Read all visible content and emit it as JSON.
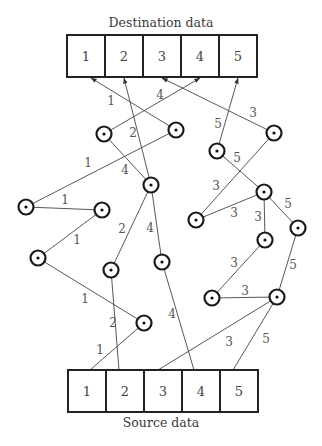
{
  "destination": {
    "title": "Destination data",
    "cells": [
      "1",
      "2",
      "3",
      "4",
      "5"
    ],
    "box": {
      "x": 67,
      "y": 35,
      "cell_w": 38,
      "h": 42
    }
  },
  "source": {
    "title": "Source data",
    "cells": [
      "1",
      "2",
      "3",
      "4",
      "5"
    ],
    "box": {
      "x": 68,
      "y": 370,
      "cell_w": 38,
      "h": 42
    }
  },
  "nodes": {
    "A": [
      104,
      134
    ],
    "B": [
      176,
      130
    ],
    "C": [
      151,
      185
    ],
    "D": [
      26,
      207
    ],
    "E": [
      102,
      210
    ],
    "F": [
      38,
      258
    ],
    "G": [
      111,
      270
    ],
    "H": [
      162,
      262
    ],
    "I": [
      144,
      323
    ],
    "J": [
      217,
      151
    ],
    "K": [
      274,
      133
    ],
    "L": [
      264,
      192
    ],
    "M": [
      196,
      220
    ],
    "N": [
      298,
      228
    ],
    "O": [
      265,
      240
    ],
    "P": [
      212,
      298
    ],
    "Q": [
      277,
      297
    ]
  },
  "edges": [
    {
      "from": "src1",
      "to": "I",
      "label": "1",
      "lp": [
        100,
        350
      ]
    },
    {
      "from": "I",
      "to": "F",
      "label": "1",
      "lp": [
        85,
        299
      ]
    },
    {
      "from": "F",
      "to": "E",
      "label": "1",
      "lp": [
        77,
        240
      ]
    },
    {
      "from": "E",
      "to": "D",
      "label": "1",
      "lp": [
        65,
        200
      ]
    },
    {
      "from": "D",
      "to": "B",
      "label": "1",
      "lp": [
        88,
        163
      ]
    },
    {
      "from": "B",
      "to": "dst1",
      "label": "1",
      "lp": [
        111,
        101
      ]
    },
    {
      "from": "src2",
      "to": "G",
      "label": "2",
      "lp": [
        113,
        323
      ]
    },
    {
      "from": "G",
      "to": "C",
      "label": "2",
      "lp": [
        122,
        229
      ]
    },
    {
      "from": "C",
      "to": "dst2",
      "label": "2",
      "lp": [
        133,
        133
      ]
    },
    {
      "from": "src4",
      "to": "H",
      "label": "4",
      "lp": [
        172,
        314
      ]
    },
    {
      "from": "H",
      "to": "C",
      "label": "4",
      "lp": [
        150,
        228
      ]
    },
    {
      "from": "C",
      "to": "A",
      "label": "4",
      "lp": [
        125,
        170
      ]
    },
    {
      "from": "A",
      "to": "dst4",
      "label": "4",
      "lp": [
        160,
        95
      ]
    },
    {
      "from": "src3",
      "to": "Q",
      "label": "3",
      "lp": [
        229,
        342
      ]
    },
    {
      "from": "Q",
      "to": "P",
      "label": "3",
      "lp": [
        245,
        291
      ]
    },
    {
      "from": "P",
      "to": "O",
      "label": "3",
      "lp": [
        234,
        263
      ]
    },
    {
      "from": "O",
      "to": "L",
      "label": "3",
      "lp": [
        258,
        217
      ]
    },
    {
      "from": "L",
      "to": "M",
      "label": "3",
      "lp": [
        234,
        213
      ]
    },
    {
      "from": "M",
      "to": "K",
      "label": "3",
      "lp": [
        216,
        186
      ]
    },
    {
      "from": "K",
      "to": "dst3",
      "label": "3",
      "lp": [
        253,
        113
      ]
    },
    {
      "from": "src5",
      "to": "Q",
      "label": "5",
      "lp": [
        266,
        339
      ]
    },
    {
      "from": "Q",
      "to": "N",
      "label": "5",
      "lp": [
        293,
        265
      ]
    },
    {
      "from": "N",
      "to": "L",
      "label": "5",
      "lp": [
        288,
        204
      ]
    },
    {
      "from": "L",
      "to": "J",
      "label": "5",
      "lp": [
        237,
        158
      ]
    },
    {
      "from": "J",
      "to": "dst5",
      "label": "5",
      "lp": [
        218,
        124
      ]
    }
  ]
}
